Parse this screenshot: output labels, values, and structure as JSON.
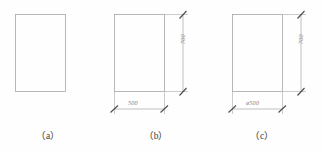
{
  "drawing": {
    "title": "",
    "background_color": "#fefefe",
    "line_color": "#9a9a9a",
    "text_color": "#7e7e7e",
    "caption_color": "#3c3c3c",
    "figures": [
      {
        "id": "a",
        "caption": "（a）",
        "shape": "rectangle",
        "dimensions_shown": false,
        "width_label": "",
        "height_label": ""
      },
      {
        "id": "b",
        "caption": "（b）",
        "shape": "rectangle",
        "dimensions_shown": true,
        "width_label": "500",
        "height_label": "700"
      },
      {
        "id": "c",
        "caption": "（c）",
        "shape": "rectangle",
        "dimensions_shown": true,
        "width_label": "ø500",
        "height_label": "700"
      }
    ]
  }
}
